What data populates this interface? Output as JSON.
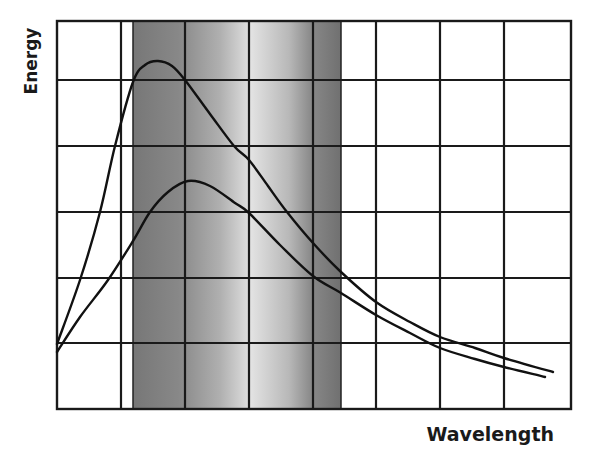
{
  "chart_data": {
    "type": "line",
    "title": "",
    "xlabel": "Wavelength",
    "ylabel": "Energy",
    "grid": true,
    "legend": null,
    "x_tick_labels": [],
    "y_tick_labels": [],
    "plot_area_px": {
      "left": 57,
      "top": 21,
      "right": 571,
      "bottom": 409
    },
    "vertical_gridlines_px": [
      121,
      185,
      249,
      313,
      376,
      440,
      504
    ],
    "horizontal_gridlines_px": [
      80,
      146,
      212,
      278,
      343
    ],
    "shaded_band": {
      "description": "visible-light region shown as a vertical grey gradient band",
      "x_start_px": 133,
      "x_end_px": 341,
      "gradient_stops": [
        {
          "offset": 0.0,
          "color": "#777777"
        },
        {
          "offset": 0.22,
          "color": "#888888"
        },
        {
          "offset": 0.42,
          "color": "#b0b0b0"
        },
        {
          "offset": 0.57,
          "color": "#e2e2e2"
        },
        {
          "offset": 0.75,
          "color": "#b8b8b8"
        },
        {
          "offset": 0.86,
          "color": "#888888"
        },
        {
          "offset": 1.0,
          "color": "#707070"
        }
      ]
    },
    "series": [
      {
        "name": "higher-temperature curve",
        "color": "#111111",
        "points_px": [
          [
            57,
            344
          ],
          [
            80,
            280
          ],
          [
            100,
            212
          ],
          [
            115,
            146
          ],
          [
            133,
            82
          ],
          [
            145,
            65
          ],
          [
            158,
            61
          ],
          [
            172,
            66
          ],
          [
            185,
            80
          ],
          [
            210,
            114
          ],
          [
            234,
            146
          ],
          [
            249,
            160
          ],
          [
            268,
            186
          ],
          [
            287,
            212
          ],
          [
            313,
            243
          ],
          [
            341,
            272
          ],
          [
            376,
            302
          ],
          [
            410,
            322
          ],
          [
            440,
            337
          ],
          [
            475,
            348
          ],
          [
            504,
            358
          ],
          [
            553,
            372
          ]
        ]
      },
      {
        "name": "lower-temperature curve",
        "color": "#111111",
        "points_px": [
          [
            57,
            352
          ],
          [
            80,
            317
          ],
          [
            108,
            280
          ],
          [
            133,
            241
          ],
          [
            150,
            212
          ],
          [
            168,
            192
          ],
          [
            188,
            181
          ],
          [
            210,
            186
          ],
          [
            235,
            203
          ],
          [
            249,
            213
          ],
          [
            280,
            245
          ],
          [
            313,
            276
          ],
          [
            341,
            293
          ],
          [
            376,
            315
          ],
          [
            410,
            333
          ],
          [
            440,
            348
          ],
          [
            475,
            359
          ],
          [
            504,
            367
          ],
          [
            545,
            377
          ]
        ]
      }
    ]
  }
}
